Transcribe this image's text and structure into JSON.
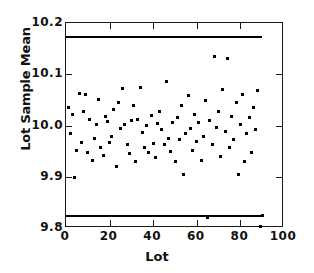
{
  "chart_data": {
    "type": "scatter",
    "title": "",
    "xlabel": "Lot",
    "ylabel": "Lot Sample Mean",
    "xlim": [
      0,
      100
    ],
    "ylim": [
      9.8,
      10.2
    ],
    "xticks": [
      "0",
      "20",
      "40",
      "60",
      "80",
      "100"
    ],
    "xtick_values": [
      0,
      20,
      40,
      60,
      80,
      100
    ],
    "yticks": [
      "9.8",
      "9.9",
      "10.0",
      "10.1",
      "10.2"
    ],
    "ytick_values": [
      9.8,
      9.9,
      10.0,
      10.1,
      10.2
    ],
    "grid": false,
    "legend": null,
    "control_limits": [
      {
        "name": "upper-control-limit",
        "value": 10.175,
        "x_start": 0,
        "x_end": 90
      },
      {
        "name": "lower-control-limit",
        "value": 9.825,
        "x_start": 0,
        "x_end": 90
      }
    ],
    "series": [
      {
        "name": "Lot Sample Mean",
        "marker": "square",
        "color": "#000000",
        "x": [
          1,
          2,
          3,
          4,
          5,
          6,
          7,
          8,
          9,
          10,
          11,
          12,
          13,
          14,
          15,
          16,
          17,
          18,
          19,
          20,
          21,
          22,
          23,
          24,
          25,
          26,
          27,
          28,
          29,
          30,
          31,
          32,
          33,
          34,
          35,
          36,
          37,
          38,
          39,
          40,
          41,
          42,
          43,
          44,
          45,
          46,
          47,
          48,
          49,
          50,
          51,
          52,
          53,
          54,
          55,
          56,
          57,
          58,
          59,
          60,
          61,
          62,
          63,
          64,
          65,
          66,
          67,
          68,
          69,
          70,
          71,
          72,
          73,
          74,
          75,
          76,
          77,
          78,
          79,
          80,
          81,
          82,
          83,
          84,
          85,
          86,
          87,
          88,
          89,
          90
        ],
        "y": [
          10.035,
          9.985,
          10.022,
          9.898,
          9.952,
          10.062,
          9.966,
          10.028,
          10.06,
          9.947,
          10.012,
          9.932,
          9.975,
          10.002,
          10.05,
          9.958,
          9.942,
          10.018,
          10.008,
          9.966,
          9.978,
          10.032,
          9.92,
          10.044,
          9.995,
          10.072,
          10.002,
          9.962,
          9.945,
          10.01,
          10.04,
          9.93,
          10.012,
          10.074,
          9.986,
          9.958,
          10.0,
          9.948,
          10.02,
          9.965,
          9.938,
          10.004,
          10.028,
          9.992,
          9.962,
          10.086,
          9.975,
          9.95,
          10.006,
          9.93,
          10.015,
          9.972,
          10.04,
          9.905,
          9.985,
          10.058,
          9.995,
          9.952,
          10.022,
          9.968,
          10.005,
          9.932,
          9.978,
          10.048,
          9.82,
          10.01,
          9.962,
          10.135,
          9.996,
          10.028,
          9.94,
          10.07,
          9.988,
          10.13,
          9.958,
          10.018,
          9.972,
          10.044,
          9.905,
          10.002,
          10.06,
          9.93,
          9.985,
          10.015,
          9.948,
          10.035,
          9.992,
          10.068,
          9.802,
          9.825
        ]
      }
    ]
  },
  "axis": {
    "y_title": "Lot Sample Mean",
    "x_title": "Lot"
  }
}
